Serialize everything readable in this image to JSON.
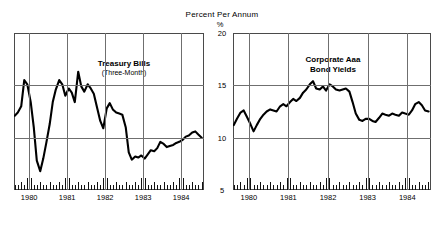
{
  "figure": {
    "title": "Percent Per Annum",
    "unit_label": "%"
  },
  "axis": {
    "y_ticks": [
      "20",
      "15",
      "10",
      "5"
    ],
    "x_ticks": [
      "1980",
      "1981",
      "1982",
      "1983",
      "1984"
    ]
  },
  "panels": {
    "left": {
      "label_main": "Treasury Bills",
      "label_sub": "(Three-Month)"
    },
    "right": {
      "label_main": "Corporate Aaa",
      "label_sub": "Bond Yields"
    }
  },
  "colors": {
    "line": "#000000",
    "frame": "#4a4a4a",
    "grid": "#6f6f6f",
    "recession_band": "#e2e2e2",
    "plot_background": "#ffffff"
  },
  "chart_data": [
    {
      "type": "line",
      "title": "Treasury Bills",
      "subtitle": "(Three-Month)",
      "xlabel": "",
      "ylabel": "Percent Per Annum",
      "unit": "%",
      "xlim": [
        1979.6,
        1984.6
      ],
      "ylim": [
        5,
        20
      ],
      "yticks": [
        5,
        10,
        15,
        20
      ],
      "xticks": [
        1980,
        1981,
        1982,
        1983,
        1984
      ],
      "grid": true,
      "legend": "none",
      "shaded_regions": [
        {
          "name": "recession-1980",
          "x0": 1980.0,
          "x1": 1980.58
        },
        {
          "name": "recession-1981-82",
          "x0": 1981.08,
          "x1": 1981.92
        }
      ],
      "x": [
        1979.62,
        1979.7,
        1979.79,
        1979.87,
        1979.95,
        1980.04,
        1980.12,
        1980.2,
        1980.29,
        1980.37,
        1980.45,
        1980.54,
        1980.62,
        1980.7,
        1980.79,
        1980.87,
        1980.95,
        1981.04,
        1981.12,
        1981.2,
        1981.29,
        1981.37,
        1981.45,
        1981.54,
        1981.62,
        1981.7,
        1981.79,
        1981.87,
        1981.95,
        1982.04,
        1982.12,
        1982.2,
        1982.29,
        1982.37,
        1982.45,
        1982.54,
        1982.62,
        1982.7,
        1982.79,
        1982.87,
        1982.95,
        1983.04,
        1983.12,
        1983.2,
        1983.29,
        1983.37,
        1983.45,
        1983.54,
        1983.62,
        1983.7,
        1983.79,
        1983.87,
        1983.95,
        1984.04,
        1984.12,
        1984.2,
        1984.29,
        1984.37,
        1984.45,
        1984.54
      ],
      "y": [
        12.1,
        12.4,
        13.0,
        15.5,
        15.1,
        13.4,
        11.0,
        7.8,
        6.8,
        8.0,
        9.5,
        11.3,
        13.4,
        14.6,
        15.5,
        15.1,
        14.0,
        14.7,
        14.3,
        13.4,
        16.3,
        14.9,
        14.4,
        15.1,
        14.7,
        14.2,
        12.8,
        11.6,
        10.9,
        12.8,
        13.3,
        12.7,
        12.4,
        12.3,
        12.2,
        11.0,
        8.6,
        7.9,
        8.2,
        8.1,
        8.3,
        8.0,
        8.4,
        8.8,
        8.7,
        9.0,
        9.6,
        9.4,
        9.1,
        9.2,
        9.3,
        9.5,
        9.6,
        9.8,
        10.1,
        10.2,
        10.5,
        10.6,
        10.3,
        10.0
      ]
    },
    {
      "type": "line",
      "title": "Corporate Aaa Bond Yields",
      "subtitle": "",
      "xlabel": "",
      "ylabel": "Percent Per Annum",
      "unit": "%",
      "xlim": [
        1979.6,
        1984.6
      ],
      "ylim": [
        5,
        20
      ],
      "yticks": [
        5,
        10,
        15,
        20
      ],
      "xticks": [
        1980,
        1981,
        1982,
        1983,
        1984
      ],
      "grid": true,
      "legend": "none",
      "shaded_regions": [
        {
          "name": "recession-1980",
          "x0": 1980.0,
          "x1": 1980.58
        },
        {
          "name": "recession-1981-82",
          "x0": 1981.08,
          "x1": 1981.92
        }
      ],
      "x": [
        1979.62,
        1979.7,
        1979.79,
        1979.87,
        1979.95,
        1980.04,
        1980.12,
        1980.2,
        1980.29,
        1980.37,
        1980.45,
        1980.54,
        1980.62,
        1980.7,
        1980.79,
        1980.87,
        1980.95,
        1981.04,
        1981.12,
        1981.2,
        1981.29,
        1981.37,
        1981.45,
        1981.54,
        1981.62,
        1981.7,
        1981.79,
        1981.87,
        1981.95,
        1982.04,
        1982.12,
        1982.2,
        1982.29,
        1982.37,
        1982.45,
        1982.54,
        1982.62,
        1982.7,
        1982.79,
        1982.87,
        1982.95,
        1983.04,
        1983.12,
        1983.2,
        1983.29,
        1983.37,
        1983.45,
        1983.54,
        1983.62,
        1983.7,
        1983.79,
        1983.87,
        1983.95,
        1984.04,
        1984.12,
        1984.2,
        1984.29,
        1984.37,
        1984.45,
        1984.54
      ],
      "y": [
        11.2,
        11.8,
        12.4,
        12.6,
        12.0,
        11.3,
        10.6,
        11.2,
        11.8,
        12.2,
        12.5,
        12.7,
        12.6,
        12.5,
        13.0,
        13.2,
        13.0,
        13.4,
        13.7,
        13.5,
        13.8,
        14.3,
        14.6,
        15.1,
        15.4,
        14.7,
        14.6,
        14.9,
        14.5,
        15.1,
        14.9,
        14.6,
        14.5,
        14.6,
        14.7,
        14.4,
        13.4,
        12.3,
        11.7,
        11.6,
        11.8,
        11.8,
        11.6,
        11.5,
        11.9,
        12.3,
        12.2,
        12.1,
        12.3,
        12.2,
        12.1,
        12.4,
        12.3,
        12.2,
        12.6,
        13.2,
        13.4,
        13.1,
        12.6,
        12.5
      ]
    }
  ]
}
